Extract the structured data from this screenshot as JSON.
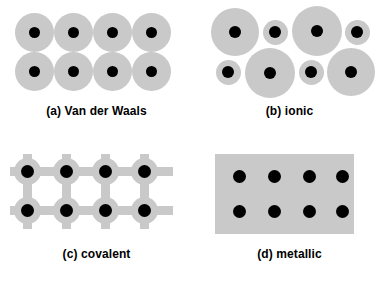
{
  "figure": {
    "background_color": "#ffffff",
    "shell_color": "#c9c9c9",
    "core_color": "#000000",
    "panel_count": 4,
    "panel_grid": "2 x 2"
  },
  "panels": [
    {
      "id": "a",
      "key": "van-der-waals",
      "caption": "(a) Van der Waals",
      "label_prefix": "(a)",
      "label_text": "Van der Waals",
      "arrangement": "close-packed 4 x 2 array of identical neutral atoms",
      "atom_count": 8,
      "rows": 2,
      "columns": 4,
      "atom_kinds": [
        "uniform"
      ],
      "shell_diameter_px": 39,
      "core_diameter_px": 11,
      "shells_touching": true
    },
    {
      "id": "b",
      "key": "ionic",
      "caption": "(b) ionic",
      "label_prefix": "(b)",
      "label_text": "ionic",
      "arrangement": "alternating large anions and small cations in a checkerboard",
      "atom_count": 8,
      "rows": 2,
      "columns": 4,
      "atom_kinds": [
        "large-ion",
        "small-ion"
      ],
      "large_shell_diameter_px": 48,
      "large_core_diameter_px": 12,
      "small_shell_diameter_px": 25,
      "small_core_diameter_px": 12,
      "top_row_sequence": [
        "large",
        "small",
        "large",
        "small"
      ],
      "bottom_row_sequence": [
        "small",
        "large",
        "small",
        "large"
      ]
    },
    {
      "id": "c",
      "key": "covalent",
      "caption": "(c) covalent",
      "label_prefix": "(c)",
      "label_text": "covalent",
      "arrangement": "directional bond network forming a square lattice with open voids",
      "atom_count": 8,
      "rows": 2,
      "columns": 4,
      "atom_kinds": [
        "bonded-node"
      ],
      "shell_diameter_px": 26,
      "core_diameter_px": 13,
      "bond_thickness_px": 9,
      "bond_directions": [
        "left",
        "right",
        "up",
        "down"
      ]
    },
    {
      "id": "d",
      "key": "metallic",
      "caption": "(d) metallic",
      "label_prefix": "(d)",
      "label_text": "metallic",
      "arrangement": "ion cores embedded in a continuous delocalized electron sea",
      "atom_count": 8,
      "rows": 2,
      "columns": 4,
      "atom_kinds": [
        "ion-core"
      ],
      "core_diameter_px": 13,
      "sea_width_px": 139,
      "sea_height_px": 80,
      "sea_color": "#c9c9c9"
    }
  ]
}
